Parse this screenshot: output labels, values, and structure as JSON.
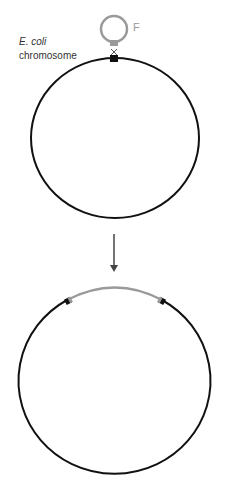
{
  "labels": {
    "organism": "E. coli",
    "chromosome": "chromosome",
    "plasmid": "F"
  },
  "colors": {
    "chromosome": "#111111",
    "plasmid": "#9a9a9a",
    "marker": "#111111",
    "arrow": "#444444"
  },
  "panels": [
    {
      "name": "before-integration",
      "description": "F plasmid pairing with E. coli chromosome at a single crossover site"
    },
    {
      "name": "after-integration",
      "description": "F plasmid integrated into chromosome (Hfr)"
    }
  ]
}
